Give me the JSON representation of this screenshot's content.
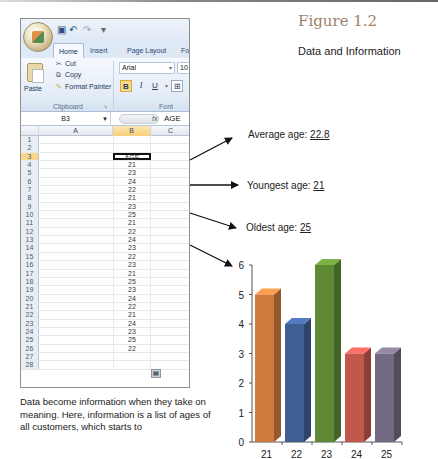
{
  "figure": {
    "title": "Figure 1.2",
    "subtitle": "Data and Information"
  },
  "excel": {
    "quick_access": [
      "save-icon",
      "undo-icon",
      "redo-icon"
    ],
    "tabs": [
      {
        "label": "Home",
        "active": true
      },
      {
        "label": "Insert",
        "active": false
      },
      {
        "label": "Page Layout",
        "active": false
      },
      {
        "label": "Fo",
        "active": false
      }
    ],
    "clipboard": {
      "paste_label": "Paste",
      "cut_label": "Cut",
      "copy_label": "Copy",
      "format_painter_label": "Format Painter",
      "group_label": "Clipboard"
    },
    "font": {
      "font_name": "Arial",
      "font_size": "10",
      "bold": "B",
      "italic": "I",
      "underline": "U",
      "group_label": "Font"
    },
    "formula_bar": {
      "name_box": "B3",
      "fx": "fx",
      "value": "AGE"
    },
    "columns": [
      "A",
      "B",
      "C"
    ],
    "rows": [
      {
        "n": "1",
        "b": ""
      },
      {
        "n": "2",
        "b": ""
      },
      {
        "n": "3",
        "b": "AGE",
        "selected": true
      },
      {
        "n": "4",
        "b": "21"
      },
      {
        "n": "5",
        "b": "23"
      },
      {
        "n": "6",
        "b": "24"
      },
      {
        "n": "7",
        "b": "22"
      },
      {
        "n": "8",
        "b": "21"
      },
      {
        "n": "9",
        "b": "23"
      },
      {
        "n": "10",
        "b": "25"
      },
      {
        "n": "11",
        "b": "21"
      },
      {
        "n": "12",
        "b": "22"
      },
      {
        "n": "13",
        "b": "24"
      },
      {
        "n": "14",
        "b": "23"
      },
      {
        "n": "15",
        "b": "22"
      },
      {
        "n": "16",
        "b": "23"
      },
      {
        "n": "17",
        "b": "21"
      },
      {
        "n": "18",
        "b": "25"
      },
      {
        "n": "19",
        "b": "23"
      },
      {
        "n": "20",
        "b": "24"
      },
      {
        "n": "21",
        "b": "22"
      },
      {
        "n": "22",
        "b": "21"
      },
      {
        "n": "23",
        "b": "24"
      },
      {
        "n": "24",
        "b": "23"
      },
      {
        "n": "25",
        "b": "25"
      },
      {
        "n": "26",
        "b": "22"
      },
      {
        "n": "27",
        "b": ""
      },
      {
        "n": "28",
        "b": ""
      }
    ]
  },
  "stats": {
    "average_label": "Average age: ",
    "average_value": "22.8",
    "youngest_label": "Youngest age: ",
    "youngest_value": "21",
    "oldest_label": "Oldest age: ",
    "oldest_value": "25"
  },
  "caption": "Data become information when they take on meaning.  Here, information is a list of ages of all customers, which starts  to",
  "chart_data": {
    "type": "bar",
    "title": "",
    "xlabel": "",
    "ylabel": "",
    "categories": [
      "21",
      "22",
      "23",
      "24",
      "25"
    ],
    "values": [
      5,
      4,
      6,
      3,
      3
    ],
    "colors": [
      "#d07a3c",
      "#3f5f93",
      "#5f8a35",
      "#c2574c",
      "#726a80"
    ],
    "ylim": [
      0,
      6
    ],
    "yticks": [
      "0",
      "1",
      "2",
      "3",
      "4",
      "5",
      "6"
    ],
    "grid": false,
    "legend": false,
    "style": "3d-column"
  }
}
